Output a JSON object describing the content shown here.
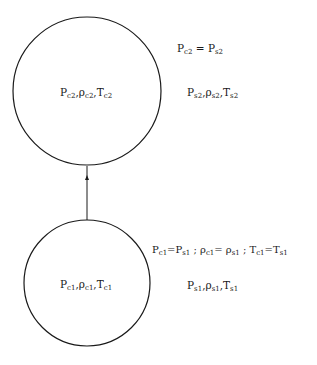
{
  "diagram": {
    "upper_state": {
      "circle_label": {
        "P": "P",
        "P_sub": "c2",
        "rho": "ρ",
        "rho_sub": "c2",
        "T": "T",
        "T_sub": "c2"
      },
      "equality": {
        "lhs": "P",
        "lhs_sub": "c2",
        "op": " = ",
        "rhs": "P",
        "rhs_sub": "s2"
      },
      "surroundings": {
        "P": "P",
        "P_sub": "s2",
        "rho": "ρ",
        "rho_sub": "s2",
        "T": "T",
        "T_sub": "s2"
      }
    },
    "lower_state": {
      "circle_label": {
        "P": "P",
        "P_sub": "c1",
        "rho": "ρ",
        "rho_sub": "c1",
        "T": "T",
        "T_sub": "c1"
      },
      "equality": {
        "p_lhs": "P",
        "p_lhs_sub": "c1",
        "p_op": "=",
        "p_rhs": "P",
        "p_rhs_sub": "s1",
        "sep1": " ; ",
        "r_lhs": "ρ",
        "r_lhs_sub": "c1",
        "r_op": "= ",
        "r_rhs": "ρ",
        "r_rhs_sub": "s1",
        "sep2": " ; ",
        "t_lhs": "T",
        "t_lhs_sub": "c1",
        "t_op": "=",
        "t_rhs": "T",
        "t_rhs_sub": "s1"
      },
      "surroundings": {
        "P": "P",
        "P_sub": "s1",
        "rho": "ρ",
        "rho_sub": "s1",
        "T": "T",
        "T_sub": "s1"
      }
    },
    "comma": ",",
    "colors": {
      "stroke": "#1a1a1a",
      "background": "#ffffff"
    }
  }
}
